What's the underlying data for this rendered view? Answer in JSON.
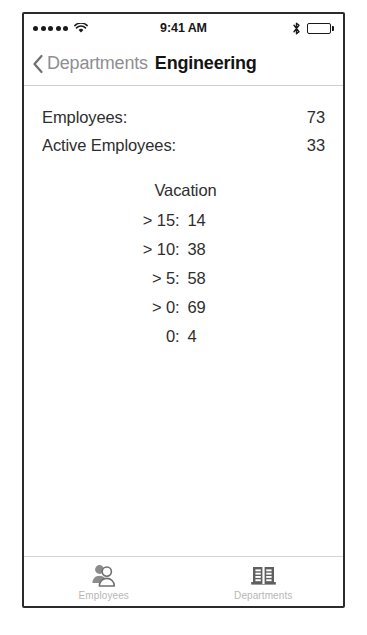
{
  "status_bar": {
    "signal_icon": "signal-dots-icon",
    "signal_dots": 5,
    "wifi_icon": "wifi-icon",
    "time": "9:41 AM",
    "bluetooth_icon": "bluetooth-icon",
    "battery_icon": "battery-full-icon"
  },
  "nav": {
    "back_icon": "chevron-left-icon",
    "back_label": "Departments",
    "title": "Engineering"
  },
  "main": {
    "stats": [
      {
        "label": "Employees:",
        "value": "73"
      },
      {
        "label": "Active Employees:",
        "value": "33"
      }
    ],
    "vacation": {
      "title": "Vacation",
      "rows": [
        {
          "key": "> 15:",
          "value": "14"
        },
        {
          "key": "> 10:",
          "value": "38"
        },
        {
          "key": "> 5:",
          "value": "58"
        },
        {
          "key": "> 0:",
          "value": "69"
        },
        {
          "key": "0:",
          "value": "4"
        }
      ]
    }
  },
  "tab_bar": {
    "tabs": [
      {
        "label": "Employees",
        "icon": "people-icon"
      },
      {
        "label": "Departments",
        "icon": "building-icon"
      }
    ]
  },
  "colors": {
    "text": "#2e2e2e",
    "muted": "#8e8e93",
    "tab_label": "#b6b6b6",
    "frame": "#2b2b2b"
  }
}
